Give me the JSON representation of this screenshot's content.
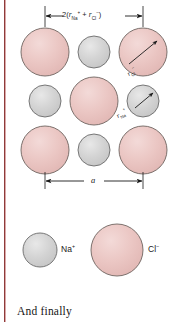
{
  "figure": {
    "title_caption": "And finally",
    "colors": {
      "anion_fill": "#e9c2c0",
      "anion_fill_light": "#f0d2d0",
      "anion_stroke": "#6e6460",
      "cation_fill": "#d2d2d2",
      "cation_fill_light": "#e2e2e2",
      "cation_stroke": "#6b6b6b",
      "margin_rule": "#8e3a3a",
      "line": "#1a1a1a",
      "text": "#1a1a1a"
    },
    "dimensions": {
      "top": {
        "label_parts": {
          "prefix": "2(",
          "r1_sym": "r",
          "r1_sub": "Na",
          "r1_sup": "+",
          "plus": " + ",
          "r2_sym": "r",
          "r2_sub": "Cl",
          "r2_sup": "−",
          "suffix": ")"
        },
        "label_text": "2(rNa+ + rCl−)",
        "name": "edge-length-relation"
      },
      "bottom": {
        "label_text": "a",
        "name": "lattice-parameter-a"
      }
    },
    "callouts": [
      {
        "id": "r-cl",
        "sym": "r",
        "sub": "Cl",
        "sup": "−",
        "target": "chloride-ion-radius"
      },
      {
        "id": "r-na",
        "sym": "r",
        "sub": "Na",
        "sup": "+",
        "target": "sodium-ion-radius"
      }
    ],
    "legend": {
      "items": [
        {
          "id": "na",
          "sym": "Na",
          "charge": "+",
          "text": "Na+",
          "species": "cation",
          "color": "#d2d2d2"
        },
        {
          "id": "cl",
          "sym": "Cl",
          "charge": "−",
          "text": "Cl−",
          "species": "anion",
          "color": "#e9c2c0"
        }
      ]
    },
    "lattice": {
      "description": "NaCl (100) plane: large Cl− anions at corners and face center, small Na+ cations at edge midpoints",
      "anion_radius_px": 24,
      "cation_radius_px": 16,
      "anions": [
        {
          "cx": 45,
          "cy": 52
        },
        {
          "cx": 143,
          "cy": 52
        },
        {
          "cx": 94,
          "cy": 101
        },
        {
          "cx": 45,
          "cy": 150
        },
        {
          "cx": 143,
          "cy": 150
        }
      ],
      "cations": [
        {
          "cx": 94,
          "cy": 52
        },
        {
          "cx": 45,
          "cy": 101
        },
        {
          "cx": 143,
          "cy": 101
        },
        {
          "cx": 94,
          "cy": 150
        }
      ]
    }
  }
}
